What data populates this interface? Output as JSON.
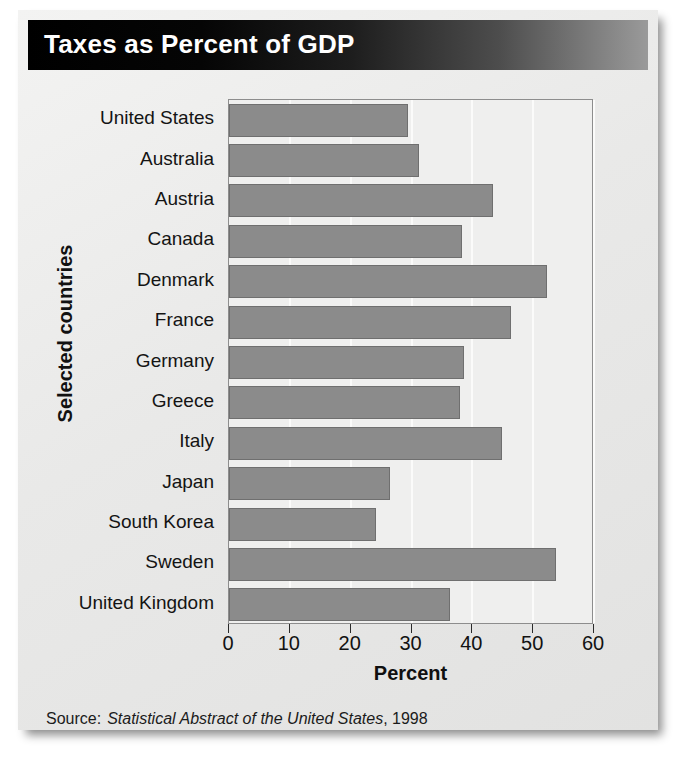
{
  "card": {
    "title": "Taxes as Percent of GDP",
    "source_label": "Source:",
    "source_title": "Statistical Abstract of the United States",
    "source_year": ", 1998"
  },
  "colors": {
    "title_bar_dark": "#000000",
    "title_bar_light": "#9a9a9a",
    "bar_fill": "#8b8b8b",
    "bar_border": "#6f6f6f",
    "plot_background": "#efefee",
    "plot_border": "#8d8d8d",
    "card_background": "#ececeb",
    "gridline": "#fbfbfa",
    "text": "#141414"
  },
  "chart_data": {
    "type": "bar",
    "orientation": "horizontal",
    "title": "Taxes as Percent of GDP",
    "xlabel": "Percent",
    "ylabel": "Selected countries",
    "xlim": [
      0,
      60
    ],
    "xticks": [
      0,
      10,
      20,
      30,
      40,
      50,
      60
    ],
    "xticklabels": [
      "0",
      "10",
      "20",
      "30",
      "40",
      "50",
      "60"
    ],
    "grid": true,
    "grid_axis": "x",
    "legend": false,
    "categories": [
      "United States",
      "Australia",
      "Austria",
      "Canada",
      "Denmark",
      "France",
      "Germany",
      "Greece",
      "Italy",
      "Japan",
      "South Korea",
      "Sweden",
      "United Kingdom"
    ],
    "values": [
      29.5,
      31.3,
      43.4,
      38.3,
      52.2,
      46.4,
      38.6,
      37.9,
      44.9,
      26.5,
      24.2,
      53.7,
      36.3
    ],
    "units": "percent of GDP"
  }
}
